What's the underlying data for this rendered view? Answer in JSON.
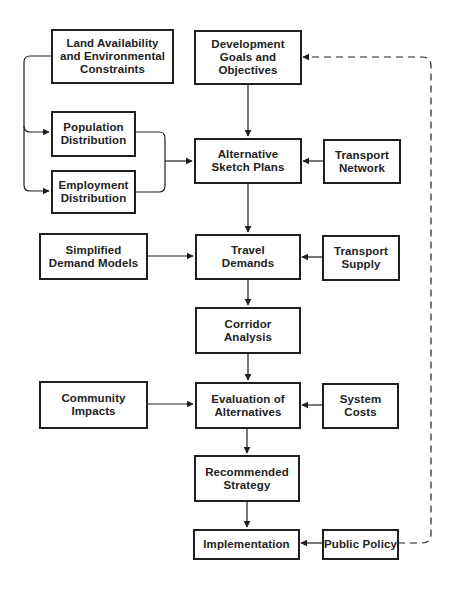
{
  "diagram": {
    "type": "flowchart",
    "colors": {
      "line": "#1f1f1f",
      "background": "#ffffff"
    },
    "nodes": {
      "land": {
        "label": "Land  Availability\nand Environmental\nConstraints"
      },
      "goals": {
        "label": "Development\nGoals and\nObjectives"
      },
      "population": {
        "label": "Population\nDistribution"
      },
      "employment": {
        "label": "Employment\nDistribution"
      },
      "sketch": {
        "label": "Alternative\nSketch Plans"
      },
      "network": {
        "label": "Transport\nNetwork"
      },
      "models": {
        "label": "Simplified\nDemand Models"
      },
      "travel": {
        "label": "Travel\nDemands"
      },
      "supply": {
        "label": "Transport\nSupply"
      },
      "corridor": {
        "label": "Corridor\nAnalysis"
      },
      "community": {
        "label": "Community\nImpacts"
      },
      "evaluation": {
        "label": "Evaluation of\nAlternatives"
      },
      "costs": {
        "label": "System\nCosts"
      },
      "strategy": {
        "label": "Recommended\nStrategy"
      },
      "implementation": {
        "label": "Implementation"
      },
      "policy": {
        "label": "Public Policy"
      }
    },
    "edges": [
      {
        "from": "land",
        "to": "population",
        "style": "solid"
      },
      {
        "from": "land",
        "to": "employment",
        "style": "solid"
      },
      {
        "from": "population",
        "to": "sketch",
        "style": "solid"
      },
      {
        "from": "employment",
        "to": "sketch",
        "style": "solid"
      },
      {
        "from": "goals",
        "to": "sketch",
        "style": "solid"
      },
      {
        "from": "network",
        "to": "sketch",
        "style": "solid"
      },
      {
        "from": "sketch",
        "to": "travel",
        "style": "solid"
      },
      {
        "from": "models",
        "to": "travel",
        "style": "solid"
      },
      {
        "from": "supply",
        "to": "travel",
        "style": "solid"
      },
      {
        "from": "travel",
        "to": "corridor",
        "style": "solid"
      },
      {
        "from": "corridor",
        "to": "evaluation",
        "style": "solid"
      },
      {
        "from": "community",
        "to": "evaluation",
        "style": "solid"
      },
      {
        "from": "costs",
        "to": "evaluation",
        "style": "solid"
      },
      {
        "from": "evaluation",
        "to": "strategy",
        "style": "solid"
      },
      {
        "from": "strategy",
        "to": "implementation",
        "style": "solid"
      },
      {
        "from": "policy",
        "to": "implementation",
        "style": "solid"
      },
      {
        "from": "policy",
        "to": "goals",
        "style": "dashed"
      }
    ]
  }
}
